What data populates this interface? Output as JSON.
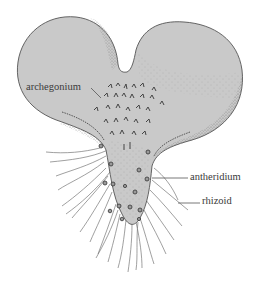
{
  "figure": {
    "colors": {
      "background": "#ffffff",
      "thallus_fill": "#c9c9c9",
      "outline": "#555555",
      "stipple": "#6a6a6a",
      "label_text": "#3a3a3a",
      "leader_line": "#555555"
    },
    "labels": [
      {
        "id": "archegonium",
        "text": "archegonium",
        "x": 26,
        "y": 82,
        "target_x": 101,
        "target_y": 98
      },
      {
        "id": "antheridium",
        "text": "antheridium",
        "x": 190,
        "y": 176,
        "target_x": 152,
        "target_y": 178
      },
      {
        "id": "rhizoid",
        "text": "rhizoid",
        "x": 202,
        "y": 199,
        "target_x": 178,
        "target_y": 203
      }
    ]
  }
}
